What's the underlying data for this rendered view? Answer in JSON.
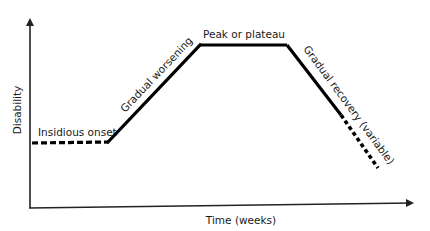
{
  "diagram": {
    "type": "disease-course-schematic",
    "axes": {
      "x_label": "Time (weeks)",
      "y_label": "Disability"
    },
    "phases": [
      {
        "id": "onset",
        "label": "Insidious onset",
        "style": "dashed"
      },
      {
        "id": "worsening",
        "label": "Gradual worsening",
        "style": "solid"
      },
      {
        "id": "plateau",
        "label": "Peak or plateau",
        "style": "solid"
      },
      {
        "id": "recovery",
        "label": "Gradual recovery (variable)",
        "style": "solid-then-dashed"
      }
    ],
    "colors": {
      "line": "#000000",
      "axis": "#222222",
      "text": "#1a1a1a",
      "background": "#ffffff"
    }
  }
}
